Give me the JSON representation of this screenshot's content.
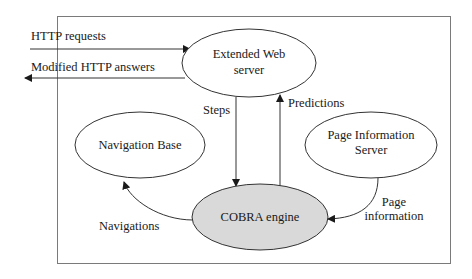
{
  "diagram": {
    "colors": {
      "stroke": "#333333",
      "frame": "#7a7a7a",
      "cobra_fill": "#d9d9d9",
      "node_fill": "#ffffff"
    },
    "nodes": {
      "web_server": {
        "line1": "Extended Web",
        "line2": "server"
      },
      "nav_base": {
        "label": "Navigation Base"
      },
      "page_info": {
        "line1": "Page Information",
        "line2": "Server"
      },
      "cobra": {
        "label": "COBRA engine"
      }
    },
    "edges": {
      "http_requests": {
        "label": "HTTP requests"
      },
      "modified_http": {
        "label": "Modified HTTP answers"
      },
      "steps": {
        "label": "Steps"
      },
      "predictions": {
        "label": "Predictions"
      },
      "navigations": {
        "label": "Navigations"
      },
      "page_information": {
        "line1": "Page",
        "line2": "information"
      }
    }
  }
}
